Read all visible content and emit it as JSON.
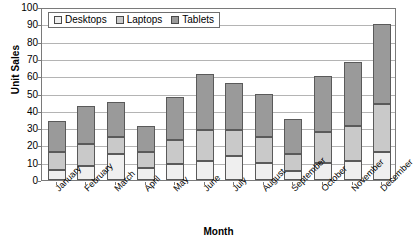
{
  "chart_data": {
    "type": "bar",
    "stacked": true,
    "title": "",
    "xlabel": "Month",
    "ylabel": "Unit Sales",
    "ylim": [
      0,
      100
    ],
    "ytick_step": 10,
    "yticks": [
      0,
      10,
      20,
      30,
      40,
      50,
      60,
      70,
      80,
      90,
      100
    ],
    "grid": true,
    "legend_position": "top-left-inside",
    "categories": [
      "January",
      "February",
      "March",
      "April",
      "May",
      "June",
      "July",
      "August",
      "September",
      "October",
      "November",
      "December"
    ],
    "series": [
      {
        "name": "Desktops",
        "color": "#efefef",
        "values": [
          6,
          8,
          15,
          7,
          9,
          11,
          14,
          10,
          5,
          10,
          11,
          16
        ]
      },
      {
        "name": "Laptops",
        "color": "#c9c9c9",
        "values": [
          10,
          13,
          10,
          9,
          14,
          18,
          15,
          15,
          10,
          17.5,
          20.5,
          28
        ]
      },
      {
        "name": "Tablets",
        "color": "#9a9a9a",
        "values": [
          18,
          22,
          20,
          15,
          25,
          32,
          27,
          25,
          20,
          32.5,
          36.5,
          46
        ]
      }
    ],
    "totals": [
      34,
      43,
      45,
      31,
      48,
      61,
      56,
      50,
      35,
      60,
      68,
      90
    ],
    "cumulative": {
      "desktops_top": [
        6,
        8,
        15,
        7,
        9,
        11,
        14,
        10,
        5,
        10,
        11,
        16
      ],
      "laptops_top": [
        16,
        21,
        25,
        16,
        23,
        29,
        29,
        25,
        15,
        27.5,
        31.5,
        44
      ],
      "tablets_top": [
        34,
        43,
        45,
        31,
        48,
        61,
        56,
        50,
        35,
        60,
        68,
        90
      ]
    }
  },
  "legend": {
    "items": [
      {
        "label": "Desktops",
        "color": "#efefef"
      },
      {
        "label": "Laptops",
        "color": "#c9c9c9"
      },
      {
        "label": "Tablets",
        "color": "#9a9a9a"
      }
    ]
  },
  "axes": {
    "y_title": "Unit Sales",
    "x_title": "Month"
  },
  "colors": {
    "plot_border": "#7a7a7a",
    "gridline": "#b4b4b4",
    "bar_outline": "#5a5a5a",
    "background": "#ffffff",
    "text": "#000000"
  }
}
